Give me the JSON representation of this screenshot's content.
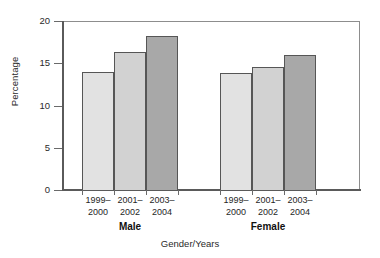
{
  "chart_data": {
    "type": "bar",
    "title": "",
    "subtitle": "",
    "xlabel": "Gender/Years",
    "ylabel": "Percentage",
    "ylim": [
      0,
      20
    ],
    "yticks": [
      0,
      5,
      10,
      15,
      20
    ],
    "ytick_labels": [
      "0",
      "5",
      "10",
      "15",
      "20"
    ],
    "grid": false,
    "legend": "none",
    "grouped": true,
    "group_labels": [
      "Male",
      "Female"
    ],
    "categories": [
      "1999–2000",
      "2001–2002",
      "2003–2004"
    ],
    "category_lines": [
      {
        "line1": "1999–",
        "line2": "2000"
      },
      {
        "line1": "2001–",
        "line2": "2002"
      },
      {
        "line1": "2003–",
        "line2": "2004"
      }
    ],
    "series": [
      {
        "name": "Male",
        "values": [
          14.0,
          16.3,
          18.2
        ]
      },
      {
        "name": "Female",
        "values": [
          13.9,
          14.5,
          16.0
        ]
      }
    ],
    "bar_colors": [
      "#e2e2e2",
      "#d2d2d2",
      "#a8a8a8"
    ],
    "bar_border_color": "#565656",
    "axis_color": "#5a5a5a",
    "frame_color": "#8d8d8d",
    "background": "#ffffff",
    "text_color": "#1a1a1a"
  },
  "axis": {
    "y_title": "Percentage",
    "x_title": "Gender/Years"
  }
}
